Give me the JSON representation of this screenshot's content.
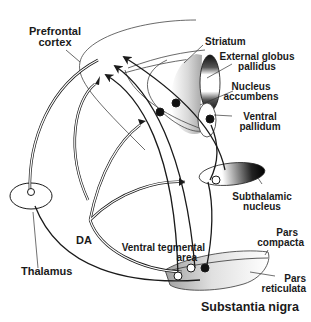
{
  "diagram": {
    "type": "neuroanatomy-circuit",
    "labels": {
      "prefrontal_cortex_line1": "Prefrontal",
      "prefrontal_cortex_line2": "cortex",
      "striatum": "Striatum",
      "external_globus_pallidus_line1": "External globus",
      "external_globus_pallidus_line2": "pallidus",
      "nucleus_accumbens_line1": "Nucleus",
      "nucleus_accumbens_line2": "accumbens",
      "ventral_pallidum_line1": "Ventral",
      "ventral_pallidum_line2": "pallidum",
      "subthalamic_nucleus_line1": "Subthalamic",
      "subthalamic_nucleus_line2": "nucleus",
      "pars_compacta_line1": "Pars",
      "pars_compacta_line2": "compacta",
      "pars_reticulata_line1": "Pars",
      "pars_reticulata_line2": "reticulata",
      "substantia_nigra": "Substantia nigra",
      "ventral_tegmental_area_line1": "Ventral tegmental",
      "ventral_tegmental_area_line2": "area",
      "da": "DA",
      "thalamus": "Thalamus"
    },
    "colors": {
      "line": "#1a1a1a",
      "background": "#ffffff",
      "shade_dark": "#111111",
      "shade_light": "#f2f2f2"
    }
  }
}
